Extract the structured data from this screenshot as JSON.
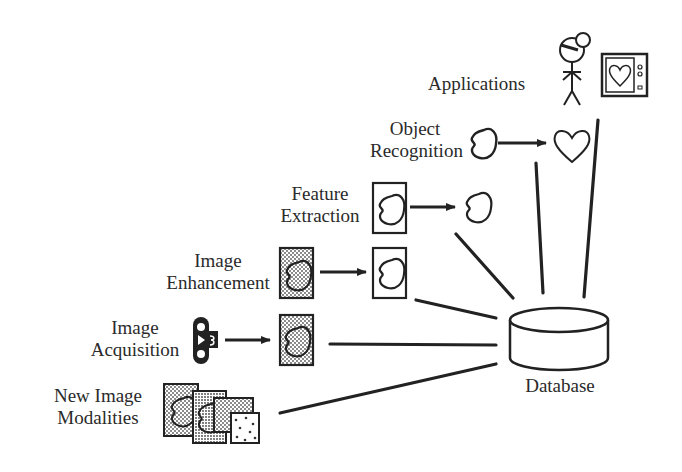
{
  "diagram": {
    "type": "image-processing-pipeline",
    "nodes": [
      {
        "id": "applications",
        "label": "Applications"
      },
      {
        "id": "object_recognition",
        "label_line1": "Object",
        "label_line2": "Recognition"
      },
      {
        "id": "feature_extraction",
        "label_line1": "Feature",
        "label_line2": "Extraction"
      },
      {
        "id": "image_enhancement",
        "label_line1": "Image",
        "label_line2": "Enhancement"
      },
      {
        "id": "image_acquisition",
        "label_line1": "Image",
        "label_line2": "Acquisition"
      },
      {
        "id": "new_image_modalities",
        "label_line1": "New Image",
        "label_line2": "Modalities"
      },
      {
        "id": "database",
        "label": "Database"
      }
    ],
    "edges": [
      {
        "from": "image_acquisition",
        "to": "image_enhancement",
        "style": "arrow"
      },
      {
        "from": "image_enhancement",
        "to": "feature_extraction",
        "style": "arrow"
      },
      {
        "from": "feature_extraction",
        "to": "object_recognition",
        "style": "arrow"
      },
      {
        "from": "object_recognition",
        "to": "applications",
        "style": "arrow"
      },
      {
        "from": "new_image_modalities",
        "to": "database",
        "style": "line"
      },
      {
        "from": "image_acquisition",
        "to": "database",
        "style": "line"
      },
      {
        "from": "image_enhancement",
        "to": "database",
        "style": "line"
      },
      {
        "from": "feature_extraction",
        "to": "database",
        "style": "line"
      },
      {
        "from": "object_recognition",
        "to": "database",
        "style": "line"
      },
      {
        "from": "applications",
        "to": "database",
        "style": "line"
      }
    ],
    "icons": {
      "applications": [
        "stick-figure-doctor-icon",
        "monitor-heart-icon"
      ],
      "object_recognition": [
        "blob-outline-icon",
        "heart-outline-icon"
      ],
      "feature_extraction": [
        "framed-blob-icon",
        "blob-outline-icon"
      ],
      "image_enhancement": [
        "dotted-framed-blob-icon",
        "framed-blob-icon"
      ],
      "image_acquisition": [
        "scanner-device-icon",
        "dotted-framed-blob-icon"
      ],
      "new_image_modalities": [
        "stacked-images-icon"
      ],
      "database": [
        "cylinder-database-icon"
      ]
    }
  }
}
